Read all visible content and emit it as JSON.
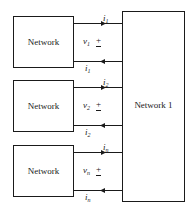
{
  "diagram": {
    "main_network": {
      "label": "Network 1"
    },
    "ports": [
      {
        "network_label": "Network",
        "current_top": "i",
        "current_bottom": "i",
        "voltage": "v",
        "subscript": "1",
        "polarity_plus": "+",
        "polarity_minus": "−"
      },
      {
        "network_label": "Network",
        "current_top": "i",
        "current_bottom": "i",
        "voltage": "v",
        "subscript": "2",
        "polarity_plus": "+",
        "polarity_minus": "−"
      },
      {
        "network_label": "Network",
        "current_top": "i",
        "current_bottom": "i",
        "voltage": "v",
        "subscript": "n",
        "polarity_plus": "+",
        "polarity_minus": "−"
      }
    ]
  }
}
